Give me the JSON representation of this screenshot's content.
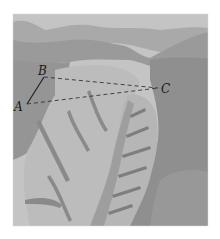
{
  "figure": {
    "points": [
      {
        "name": "A",
        "label": "A",
        "x": 27,
        "y": 104
      },
      {
        "name": "B",
        "label": "B",
        "x": 44,
        "y": 77
      },
      {
        "name": "C",
        "label": "C",
        "x": 158,
        "y": 88
      }
    ],
    "segments": [
      {
        "from": "A",
        "to": "B",
        "style": "solid"
      },
      {
        "from": "B",
        "to": "C",
        "style": "dashed"
      },
      {
        "from": "A",
        "to": "C",
        "style": "dashed"
      }
    ],
    "labels": {
      "A": "A",
      "B": "B",
      "C": "C"
    },
    "colors": {
      "sky": "#c9c9c9",
      "far_hills": "#9c9c9c",
      "mid_ground": "#a8a8a8",
      "light_slopes": "#bdbdbd",
      "dark_shade": "#8a8a8a",
      "river": "#999999",
      "lines": "#222222"
    }
  }
}
